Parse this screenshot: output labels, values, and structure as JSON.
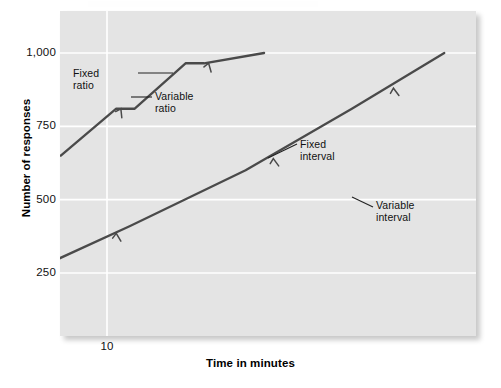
{
  "figure": {
    "background_color": "#ffffff",
    "plot_background_color": "#e4e4e4",
    "gridline_color": "#ffffff",
    "curve_color": "#4a4a4a"
  },
  "axes": {
    "y_title": "Number of responses",
    "x_title": "Time in minutes",
    "y_ticks": [
      {
        "label": "1,000",
        "value": 1000
      },
      {
        "label": "750",
        "value": 750
      },
      {
        "label": "500",
        "value": 500
      },
      {
        "label": "250",
        "value": 250
      }
    ],
    "x_ticks": [
      {
        "label": "10",
        "value": 10
      },
      {
        "label": "20",
        "value": 20
      },
      {
        "label": "30",
        "value": 30
      },
      {
        "label": "40",
        "value": 40
      },
      {
        "label": "50",
        "value": 50
      },
      {
        "label": "60",
        "value": 60
      },
      {
        "label": "70",
        "value": 70
      },
      {
        "label": "80",
        "value": 80
      }
    ]
  },
  "annotations": {
    "fixed_ratio": "Fixed\nratio",
    "variable_ratio": "Variable\nratio",
    "fixed_interval": "Fixed\ninterval",
    "variable_interval": "Variable\ninterval"
  },
  "chart_data": {
    "type": "line",
    "title": "",
    "subtitle": "",
    "xlabel": "Time in minutes",
    "ylabel": "Number of responses",
    "xlim": [
      0,
      90
    ],
    "ylim": [
      0,
      1100
    ],
    "xticks": [
      10,
      20,
      30,
      40,
      50,
      60,
      70,
      80
    ],
    "yticks": [
      250,
      500,
      750,
      1000
    ],
    "grid": true,
    "legend_position": "inline-annotations",
    "annotations": [
      {
        "text": "Fixed ratio",
        "target_series": "Fixed ratio",
        "x": 7.5,
        "y": 905
      },
      {
        "text": "Variable ratio",
        "target_series": "Variable ratio",
        "x": 22.5,
        "y": 830
      },
      {
        "text": "Fixed interval",
        "target_series": "Fixed interval",
        "x": 54.5,
        "y": 645
      },
      {
        "text": "Variable interval",
        "target_series": "Variable interval",
        "x": 70.0,
        "y": 445
      }
    ],
    "series": [
      {
        "name": "Fixed ratio",
        "style": "stepped-staircase",
        "slope_description": "very steep, pauses after each reinforcer",
        "x": [
          2.6,
          3.8,
          4.2,
          5.5,
          5.9,
          7.0,
          7.4,
          8.6,
          9.0,
          10.2,
          10.6,
          11.7,
          12.1,
          13.4
        ],
        "y": [
          60,
          170,
          170,
          315,
          315,
          490,
          490,
          650,
          650,
          810,
          810,
          965,
          965,
          1000
        ]
      },
      {
        "name": "Variable ratio",
        "style": "steady-steep-line",
        "slope_description": "steady high rate, no post-reinforcement pauses",
        "x": [
          5.9,
          8.0,
          10.5,
          13.0,
          15.3,
          17.3
        ],
        "y": [
          85,
          230,
          410,
          600,
          810,
          1000
        ]
      },
      {
        "name": "Fixed interval",
        "style": "scalloped-staircase",
        "slope_description": "scalloped — slow after reinforcer, accelerating before next",
        "x": [
          22.5,
          24.0,
          25.4,
          31.5,
          33.0,
          34.6,
          41.0,
          42.5,
          44.5,
          51.5,
          53.0,
          55.2,
          61.5,
          63.0,
          65.5,
          72.0,
          73.5,
          76.0,
          79.0
        ],
        "y": [
          185,
          230,
          290,
          290,
          320,
          385,
          385,
          410,
          480,
          480,
          500,
          570,
          570,
          590,
          665,
          665,
          690,
          760,
          762
        ]
      },
      {
        "name": "Variable interval",
        "style": "steady-moderate-line",
        "slope_description": "steady moderate rate, uniform slope",
        "x": [
          21.0,
          35.0,
          50.0,
          65.0,
          79.5
        ],
        "y": [
          110,
          250,
          400,
          545,
          690
        ]
      }
    ]
  }
}
